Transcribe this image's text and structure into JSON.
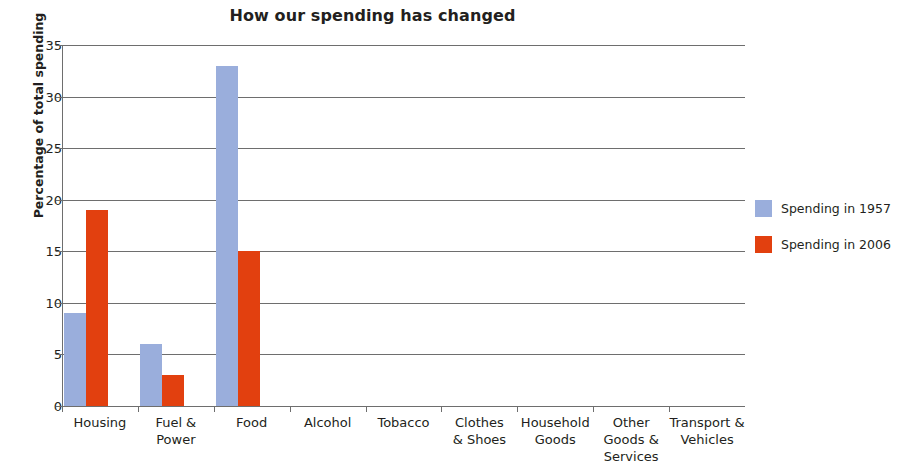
{
  "chart_data": {
    "type": "bar",
    "title": "How our spending has changed",
    "xlabel": "",
    "ylabel": "Percentage of total spending",
    "ylim": [
      0,
      35
    ],
    "ytick_step": 5,
    "yticks": [
      0,
      5,
      10,
      15,
      20,
      25,
      30,
      35
    ],
    "grid": true,
    "legend_position": "right",
    "categories": [
      "Housing",
      "Fuel & Power",
      "Food",
      "Alcohol",
      "Tobacco",
      "Clothes & Shoes",
      "Household Goods",
      "Other Goods & Services",
      "Transport & Vehicles"
    ],
    "category_lines": [
      [
        "Housing"
      ],
      [
        "Fuel &",
        "Power"
      ],
      [
        "Food"
      ],
      [
        "Alcohol"
      ],
      [
        "Tobacco"
      ],
      [
        "Clothes",
        "& Shoes"
      ],
      [
        "Household",
        "Goods"
      ],
      [
        "Other",
        "Goods &",
        "Services"
      ],
      [
        "Transport &",
        "Vehicles"
      ]
    ],
    "series": [
      {
        "name": "Spending in 1957",
        "color": "#9aaedc",
        "values": [
          9,
          6,
          33,
          0,
          0,
          0,
          0,
          0,
          0
        ]
      },
      {
        "name": "Spending in 2006",
        "color": "#e2400f",
        "values": [
          19,
          3,
          15,
          0,
          0,
          0,
          0,
          0,
          0
        ]
      }
    ]
  },
  "legend": {
    "items": [
      {
        "label": "Spending in 1957",
        "color": "#9aaedc",
        "swatch_name": "legend-swatch-1957"
      },
      {
        "label": "Spending in 2006",
        "color": "#e2400f",
        "swatch_name": "legend-swatch-2006"
      }
    ]
  },
  "colors": {
    "axis": "#6e6e6e",
    "text": "#231f20",
    "background": "#ffffff",
    "series_1957": "#9aaedc",
    "series_2006": "#e2400f"
  }
}
